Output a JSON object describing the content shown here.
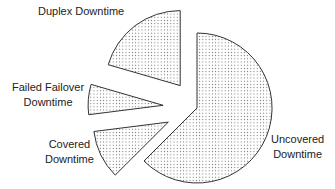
{
  "chart_data": {
    "type": "pie",
    "title": "",
    "exploded": true,
    "fill_pattern": "dotted",
    "categories": [
      "Uncovered Downtime",
      "Covered Downtime",
      "Failed Failover Downtime",
      "Duplex Downtime"
    ],
    "values": [
      62.5,
      10.5,
      6.5,
      20.5
    ],
    "unit": "percent (estimated from angles)",
    "legend": "none (direct labels)"
  },
  "labels": {
    "duplex_line1": "Duplex Downtime",
    "failed_line1": "Failed Failover",
    "failed_line2": "Downtime",
    "covered_line1": "Covered",
    "covered_line2": "Downtime",
    "uncovered_line1": "Uncovered",
    "uncovered_line2": "Downtime"
  },
  "colors": {
    "stroke": "#333333",
    "fill": "#ffffff",
    "dots": "#666666"
  }
}
